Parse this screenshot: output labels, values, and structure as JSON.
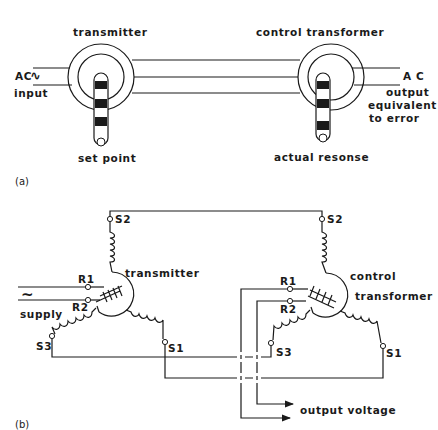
{
  "panel_a": {
    "caption": "(a)",
    "transmitter_label": "transmitter",
    "ac_input_label_1": "AC",
    "ac_symbol": "∿",
    "ac_input_label_2": "input",
    "set_point_label": "set point",
    "control_transformer_label": "control transformer",
    "ac_output_label": "A C",
    "output_label_1": "output",
    "output_label_2": "equivalent",
    "output_label_3": "to error",
    "actual_response_label": "actual resonse"
  },
  "panel_b": {
    "caption": "(b)",
    "transmitter_label": "transmitter",
    "supply_symbol": "~",
    "supply_label": "supply",
    "control_label_1": "control",
    "control_label_2": "transformer",
    "output_voltage_label": "output voltage",
    "terminals": {
      "tx_s1": "S1",
      "tx_s2": "S2",
      "tx_s3": "S3",
      "tx_r1": "R1",
      "tx_r2": "R2",
      "ct_s1": "S1",
      "ct_s2": "S2",
      "ct_s3": "S3",
      "ct_r1": "R1",
      "ct_r2": "R2"
    }
  }
}
